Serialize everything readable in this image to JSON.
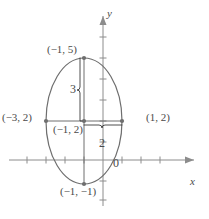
{
  "figure": {
    "kind": "ellipse-graph",
    "axes": {
      "x_axis_label": "x",
      "y_axis_label": "y",
      "origin_label": "0",
      "axis_color": "#8c8c8c",
      "tick_color": "#8c8c8c",
      "x_ticks": [
        -4,
        -3,
        -2,
        -1,
        1,
        2
      ],
      "y_ticks": [
        -1,
        1,
        2,
        3,
        4,
        5,
        6
      ],
      "x_range": [
        -4.6,
        2.6
      ],
      "y_range": [
        -2.1,
        6.4
      ]
    },
    "curve": {
      "type": "ellipse",
      "center": [
        -1,
        2
      ],
      "semi_axis_x": 2,
      "semi_axis_y": 3,
      "stroke_color": "#6e6e6e"
    },
    "points": [
      {
        "name": "top-vertex",
        "label": "(−1, 5)",
        "coords": [
          -1,
          5
        ]
      },
      {
        "name": "left-vertex",
        "label": "(−3, 2)",
        "coords": [
          -3,
          2
        ]
      },
      {
        "name": "right-vertex",
        "label": "(1, 2)",
        "coords": [
          1,
          2
        ]
      },
      {
        "name": "center-point",
        "label": "(−1, 2)",
        "coords": [
          -1,
          2
        ]
      },
      {
        "name": "bottom-vertex",
        "label": "(−1, −1)",
        "coords": [
          -1,
          -1
        ]
      }
    ],
    "braces": [
      {
        "name": "vertical-brace",
        "label": "3",
        "from": [
          -1,
          2
        ],
        "to": [
          -1,
          5
        ],
        "orientation": "vertical"
      },
      {
        "name": "horizontal-brace",
        "label": "2",
        "from": [
          -1,
          2
        ],
        "to": [
          1,
          2
        ],
        "orientation": "horizontal"
      }
    ],
    "marker_color": "#6e6e6e",
    "annotation_color": "#4a4a4a"
  }
}
